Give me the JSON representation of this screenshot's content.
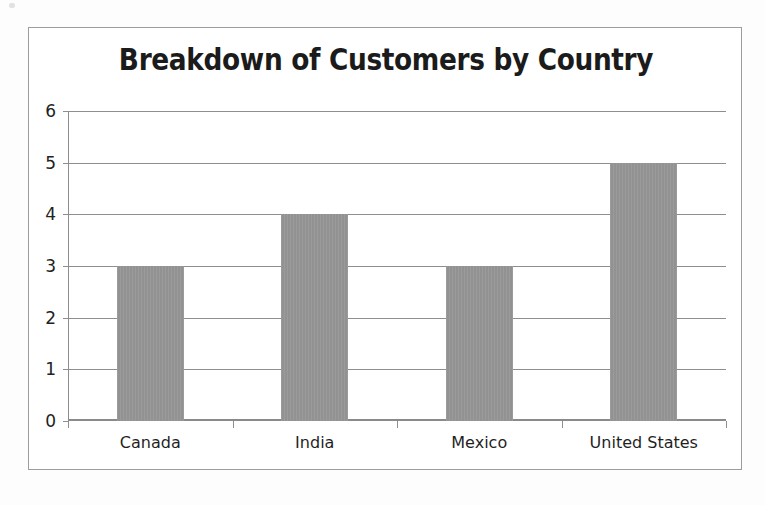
{
  "chart_data": {
    "type": "bar",
    "title": "Breakdown of Customers by Country",
    "subtitle": "",
    "xlabel": "",
    "ylabel": "",
    "categories": [
      "Canada",
      "India",
      "Mexico",
      "United States"
    ],
    "values": [
      3,
      4,
      3,
      5
    ],
    "series": [
      {
        "name": "Customers",
        "values": [
          3,
          4,
          3,
          5
        ]
      }
    ],
    "ylim": [
      0,
      6
    ],
    "ytick_labels": [
      "0",
      "1",
      "2",
      "3",
      "4",
      "5",
      "6"
    ],
    "ytick_values": [
      0,
      1,
      2,
      3,
      4,
      5,
      6
    ],
    "grid": "horizontal",
    "legend": "none",
    "bar_color": "#969696",
    "gridline_color": "#8e8e8e",
    "axis_color": "#8a8a8a",
    "title_color": "#1b1b1b",
    "border_color": "#9d9d9d",
    "background_color": "#ffffff"
  }
}
